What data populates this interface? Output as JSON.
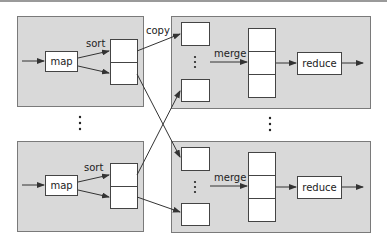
{
  "diagram": {
    "type": "mapreduce-data-flow",
    "map_tasks": [
      {
        "id": "map-top",
        "map_label": "map",
        "sort_label": "sort",
        "partitions": 2
      },
      {
        "id": "map-bottom",
        "map_label": "map",
        "sort_label": "sort",
        "partitions": 2
      }
    ],
    "reduce_tasks": [
      {
        "id": "reduce-top",
        "merge_label": "merge",
        "reduce_label": "reduce",
        "inputs": 2,
        "merged_segments": 3
      },
      {
        "id": "reduce-bottom",
        "merge_label": "merge",
        "reduce_label": "reduce",
        "inputs": 2,
        "merged_segments": 3
      }
    ],
    "copy_label": "copy",
    "ellipsis": "⋮",
    "colors": {
      "panel_fill": "#d9d9d9",
      "panel_border": "#7a7a7a",
      "box_fill": "#ffffff",
      "line": "#333333"
    }
  },
  "labels": {
    "map_top": "map",
    "map_bottom": "map",
    "sort_top": "sort",
    "sort_bottom": "sort",
    "copy": "copy",
    "merge_top": "merge",
    "merge_bottom": "merge",
    "reduce_top": "reduce",
    "reduce_bottom": "reduce"
  }
}
